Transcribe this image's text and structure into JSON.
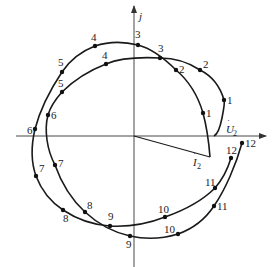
{
  "diagram": {
    "type": "phasor-locus",
    "axes": {
      "vertical_label": "j",
      "origin": [
        134,
        136
      ]
    },
    "phasors": [
      {
        "name": "U2",
        "label": "U",
        "subscript": "2",
        "has_dot": true
      },
      {
        "name": "I2",
        "label": "I",
        "subscript": "2",
        "has_dot": true
      }
    ],
    "curves": [
      {
        "name": "voltage-locus",
        "points": [
          {
            "label": "1",
            "x": 224,
            "y": 100
          },
          {
            "label": "2",
            "x": 200,
            "y": 70
          },
          {
            "label": "3",
            "x": 160,
            "y": 58
          },
          {
            "label": "4",
            "x": 106,
            "y": 64
          },
          {
            "label": "5",
            "x": 62,
            "y": 92
          },
          {
            "label": "6",
            "x": 48,
            "y": 115
          },
          {
            "label": "7",
            "x": 55,
            "y": 165
          },
          {
            "label": "8",
            "x": 85,
            "y": 212
          },
          {
            "label": "9",
            "x": 130,
            "y": 236
          },
          {
            "label": "10",
            "x": 178,
            "y": 234
          },
          {
            "label": "11",
            "x": 214,
            "y": 206
          },
          {
            "label": "12",
            "x": 242,
            "y": 143
          }
        ]
      },
      {
        "name": "current-locus",
        "points": [
          {
            "label": "1",
            "x": 203,
            "y": 113
          },
          {
            "label": "2",
            "x": 176,
            "y": 70
          },
          {
            "label": "3",
            "x": 138,
            "y": 45
          },
          {
            "label": "4",
            "x": 95,
            "y": 46
          },
          {
            "label": "5",
            "x": 62,
            "y": 72
          },
          {
            "label": "6",
            "x": 35,
            "y": 129
          },
          {
            "label": "7",
            "x": 36,
            "y": 176
          },
          {
            "label": "8",
            "x": 63,
            "y": 210
          },
          {
            "label": "9",
            "x": 110,
            "y": 226
          },
          {
            "label": "10",
            "x": 165,
            "y": 217
          },
          {
            "label": "11",
            "x": 215,
            "y": 188
          },
          {
            "label": "12",
            "x": 231,
            "y": 158
          }
        ]
      }
    ]
  }
}
